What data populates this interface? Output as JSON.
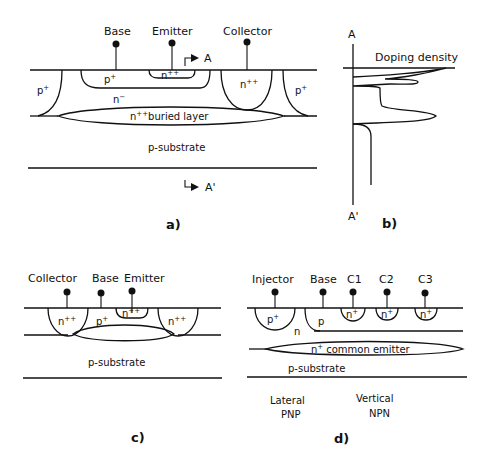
{
  "figure": {
    "panels": {
      "a": {
        "caption": "a)",
        "terminals": [
          "Base",
          "Emitter",
          "Collector"
        ],
        "regions": {
          "base": "p",
          "base_sup": "+",
          "emitter": "n",
          "emitter_sup": "++",
          "epi": "n",
          "epi_sup": "−",
          "collector_contact": "n",
          "collector_contact_sup": "++",
          "isolation_left": "p",
          "isolation_left_sup": "+",
          "isolation_right": "p",
          "isolation_right_sup": "+",
          "buried": "n",
          "buried_sup": "++",
          "buried_text": "buried layer",
          "substrate": "p-substrate"
        },
        "section_start": "A",
        "section_end": "A'"
      },
      "b": {
        "caption": "b)",
        "axis_top": "A",
        "axis_bottom": "A'",
        "x_label": "Doping density"
      },
      "c": {
        "caption": "c)",
        "terminals": [
          "Collector",
          "Base",
          "Emitter"
        ],
        "regions": {
          "collector_left": "n",
          "collector_left_sup": "++",
          "base": "p",
          "base_sup": "+",
          "emitter": "n",
          "emitter_sup": "++",
          "collector_right": "n",
          "collector_right_sup": "++",
          "substrate": "p-substrate"
        }
      },
      "d": {
        "caption": "d)",
        "terminals": [
          "Injector",
          "Base",
          "C1",
          "C2",
          "C3"
        ],
        "regions": {
          "injector": "p",
          "injector_sup": "+",
          "n_region": "n",
          "base": "p",
          "collectors": [
            "n",
            "n",
            "n"
          ],
          "collector_sup": "+",
          "emitter": "n",
          "emitter_sup": "+",
          "emitter_text": "common emitter",
          "substrate": "p-substrate"
        },
        "device_labels": {
          "lateral_line1": "Lateral",
          "lateral_line2": "PNP",
          "vertical_line1": "Vertical",
          "vertical_line2": "NPN"
        }
      }
    }
  }
}
